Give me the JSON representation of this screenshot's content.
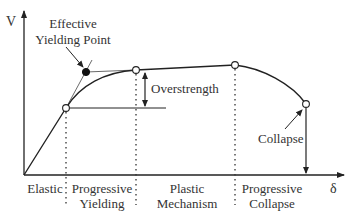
{
  "diagram": {
    "axes": {
      "y_label": "V",
      "x_label": "δ"
    },
    "annotations": {
      "effective_yield_line1": "Effective",
      "effective_yield_line2": "Yielding Point",
      "overstrength": "Overstrength",
      "collapse": "Collapse"
    },
    "regions": [
      {
        "line1": "Elastic",
        "line2": ""
      },
      {
        "line1": "Progressive",
        "line2": "Yielding"
      },
      {
        "line1": "Plastic",
        "line2": "Mechanism"
      },
      {
        "line1": "Progressive",
        "line2": "Collapse"
      }
    ],
    "colors": {
      "line": "#222222",
      "text": "#333333",
      "bg": "#ffffff"
    }
  }
}
